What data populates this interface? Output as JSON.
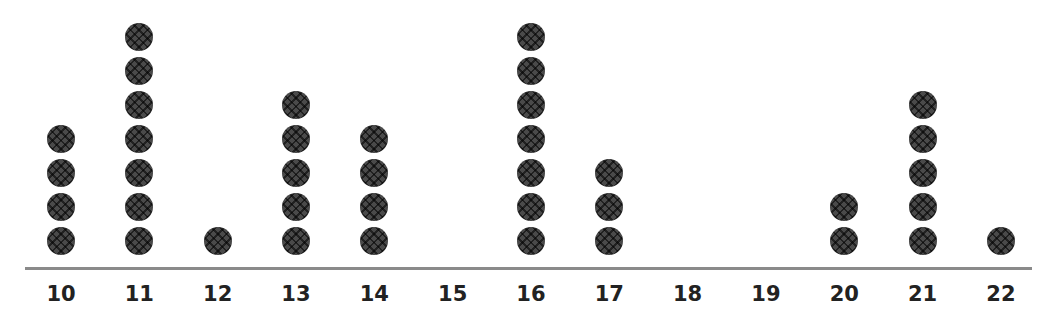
{
  "chart_data": {
    "type": "dot_plot",
    "title": "",
    "xlabel": "",
    "ylabel": "",
    "categories": [
      "10",
      "11",
      "12",
      "13",
      "14",
      "15",
      "16",
      "17",
      "18",
      "19",
      "20",
      "21",
      "22"
    ],
    "values": [
      4,
      7,
      1,
      5,
      4,
      0,
      7,
      3,
      0,
      0,
      2,
      5,
      1
    ],
    "xlim": [
      10,
      22
    ],
    "grid": false,
    "legend": null,
    "marker": "cross-hatched filled circle",
    "colors": {
      "dot": "#4a4a4a",
      "axis": "#8a8a8a",
      "text": "#222222"
    }
  },
  "layout": {
    "x_first_px": 61,
    "x_step_px": 78.33,
    "baseline_px": 241,
    "dot_step_px": 34
  }
}
